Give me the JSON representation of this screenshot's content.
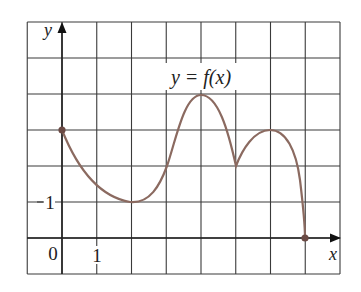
{
  "chart_data": {
    "type": "line",
    "title": "y = f(x)",
    "xlabel": "x",
    "ylabel": "y",
    "xlim": [
      -1,
      8
    ],
    "ylim": [
      -1,
      6
    ],
    "grid": true,
    "tick_labels": {
      "x": [
        "0",
        "1"
      ],
      "y": [
        "1"
      ]
    },
    "annotation": "y = f(x)",
    "series": [
      {
        "name": "f(x)",
        "points": [
          {
            "x": 0,
            "y": 3,
            "closed_endpoint": true
          },
          {
            "x": 2,
            "y": 1,
            "note": "local minimum"
          },
          {
            "x": 3,
            "y": 2
          },
          {
            "x": 4,
            "y": 4,
            "note": "local maximum"
          },
          {
            "x": 5,
            "y": 2,
            "note": "cusp"
          },
          {
            "x": 6,
            "y": 3,
            "note": "local maximum"
          },
          {
            "x": 7,
            "y": 0,
            "closed_endpoint": true
          }
        ]
      }
    ]
  },
  "colors": {
    "grid": "#3a3a3a",
    "curve": "#8b6a60",
    "endpoint": "#6b4a44",
    "text": "#222222"
  },
  "labels": {
    "y_axis": "y",
    "x_axis": "x",
    "origin": "0",
    "x_tick_1": "1",
    "y_tick_1": "1",
    "function_label": "y = f(x)"
  }
}
